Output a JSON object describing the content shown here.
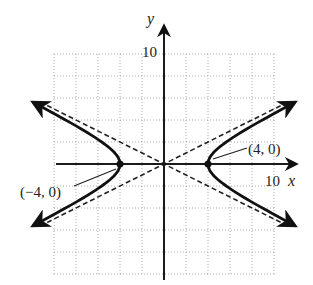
{
  "chart_data": {
    "type": "line",
    "title": "",
    "equation": "x^2/16 - y^2/4 = 1",
    "xlabel": "x",
    "ylabel": "y",
    "xlim": [
      -10,
      10
    ],
    "ylim": [
      -10,
      10
    ],
    "grid": true,
    "grid_step": 2,
    "tick_labels": {
      "x": "10",
      "y": "10"
    },
    "series": [
      {
        "name": "hyperbola-right-branch",
        "style": "solid",
        "vertex": [
          4,
          0
        ]
      },
      {
        "name": "hyperbola-left-branch",
        "style": "solid",
        "vertex": [
          -4,
          0
        ]
      },
      {
        "name": "asymptote-positive",
        "style": "dashed",
        "slope": 0.5
      },
      {
        "name": "asymptote-negative",
        "style": "dashed",
        "slope": -0.5
      }
    ],
    "annotations": [
      {
        "text": "(4, 0)",
        "point": [
          4,
          0
        ]
      },
      {
        "text": "(−4, 0)",
        "point": [
          -4,
          0
        ]
      }
    ]
  },
  "labels": {
    "x_axis": "x",
    "y_axis": "y",
    "x_tick": "10",
    "y_tick": "10",
    "right_vertex": "(4, 0)",
    "left_vertex": "(−4, 0)"
  }
}
